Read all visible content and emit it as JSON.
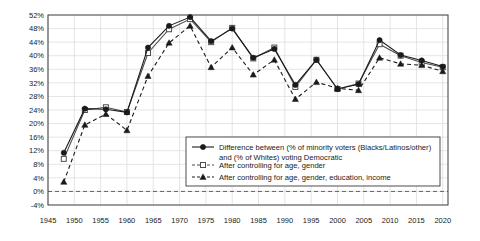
{
  "chart_data": {
    "type": "line",
    "title": "",
    "xlabel": "",
    "ylabel": "",
    "xlim": [
      1945,
      2021
    ],
    "ylim": [
      -4,
      52
    ],
    "ytick_step": 4,
    "xtick_step": 5,
    "grid": true,
    "legend_position": "inside-lower-right",
    "zero_line": true,
    "ytick_labels": [
      "-4%",
      "0%",
      "4%",
      "8%",
      "12%",
      "16%",
      "20%",
      "24%",
      "28%",
      "32%",
      "36%",
      "40%",
      "44%",
      "48%",
      "52%"
    ],
    "xtick_labels": [
      "1945",
      "1950",
      "1955",
      "1960",
      "1965",
      "1970",
      "1975",
      "1980",
      "1985",
      "1990",
      "1995",
      "2000",
      "2005",
      "2010",
      "2015",
      "2020"
    ],
    "x": [
      1948,
      1952,
      1956,
      1960,
      1964,
      1968,
      1972,
      1976,
      1980,
      1984,
      1988,
      1992,
      1996,
      2000,
      2004,
      2008,
      2012,
      2016,
      2020
    ],
    "series": [
      {
        "name": "Difference between (% of minority voters (Blacks/Latinos/other) and (% of Whites) voting Democratic",
        "marker": "filled-circle",
        "line": "solid",
        "color": "#1a1a1a",
        "values": [
          11.4,
          24.4,
          24.2,
          23.3,
          42.4,
          48.8,
          51.4,
          44.3,
          48.0,
          39.4,
          42.0,
          31.4,
          38.8,
          30.2,
          31.6,
          44.6,
          40.2,
          38.6,
          36.8
        ]
      },
      {
        "name": "After controlling for age, gender",
        "marker": "open-square",
        "line": "solid",
        "color": "#4d4d4d",
        "values": [
          9.6,
          24.0,
          24.8,
          23.4,
          40.8,
          47.8,
          50.8,
          44.0,
          48.2,
          39.2,
          42.4,
          30.8,
          38.8,
          30.2,
          31.8,
          43.4,
          40.0,
          38.0,
          36.6
        ]
      },
      {
        "name": "After controlling for age, gender, education, income",
        "marker": "filled-triangle",
        "line": "dashed",
        "color": "#1a1a1a",
        "values": [
          2.8,
          19.6,
          22.8,
          18.0,
          34.0,
          43.8,
          48.8,
          36.6,
          42.4,
          34.4,
          38.8,
          27.2,
          32.2,
          30.4,
          29.8,
          39.4,
          37.6,
          37.2,
          35.4
        ]
      }
    ]
  },
  "legend": {
    "items": [
      {
        "label_line1": "Difference between (% of minority voters (Blacks/Latinos/other)",
        "label_line2": "and (% of Whites) voting Democratic"
      },
      {
        "label_line1": "After controlling for age, gender",
        "label_line2": ""
      },
      {
        "label_line1": "After controlling for age, gender, education, income",
        "label_line2": ""
      }
    ]
  }
}
